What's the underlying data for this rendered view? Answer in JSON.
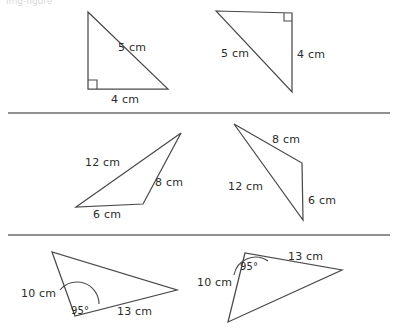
{
  "page": {
    "background_color": "#ffffff",
    "stroke_color": "#4a4a4a",
    "divider_color": "#6b6b6b",
    "text_color": "#2b2b2b",
    "cropped_top_text": "img-figure"
  },
  "rows": [
    {
      "name": "row-1-right-triangles",
      "figures": [
        {
          "name": "triangle-1",
          "labels": [
            {
              "name": "hypotenuse-label",
              "text": "5 cm",
              "x": 118,
              "y": 41
            },
            {
              "name": "base-label",
              "text": "4 cm",
              "x": 111,
              "y": 93
            }
          ],
          "right_angle": true
        },
        {
          "name": "triangle-2",
          "labels": [
            {
              "name": "hypotenuse-label",
              "text": "5 cm",
              "x": 221,
              "y": 47
            },
            {
              "name": "vertical-side-label",
              "text": "4 cm",
              "x": 297,
              "y": 48
            }
          ],
          "right_angle": true
        }
      ]
    },
    {
      "name": "row-2-scalene-triangles",
      "figures": [
        {
          "name": "triangle-3",
          "labels": [
            {
              "name": "side-12cm-label",
              "text": "12 cm",
              "x": 85,
              "y": 156
            },
            {
              "name": "side-8cm-label",
              "text": "8 cm",
              "x": 155,
              "y": 176
            },
            {
              "name": "side-6cm-label",
              "text": "6 cm",
              "x": 93,
              "y": 208
            }
          ],
          "right_angle": false
        },
        {
          "name": "triangle-4",
          "labels": [
            {
              "name": "side-8cm-label",
              "text": "8 cm",
              "x": 272,
              "y": 133
            },
            {
              "name": "side-12cm-label",
              "text": "12 cm",
              "x": 228,
              "y": 180
            },
            {
              "name": "side-6cm-label",
              "text": "6 cm",
              "x": 308,
              "y": 194
            }
          ],
          "right_angle": false
        }
      ]
    },
    {
      "name": "row-3-sas-triangles",
      "figures": [
        {
          "name": "triangle-5",
          "labels": [
            {
              "name": "side-10cm-label",
              "text": "10 cm",
              "x": 21,
              "y": 287
            },
            {
              "name": "angle-95-label",
              "text": "95°",
              "x": 71,
              "y": 305
            },
            {
              "name": "side-13cm-label",
              "text": "13 cm",
              "x": 117,
              "y": 305
            }
          ],
          "angle_marker": "95°"
        },
        {
          "name": "triangle-6",
          "labels": [
            {
              "name": "side-13cm-label",
              "text": "13 cm",
              "x": 288,
              "y": 250
            },
            {
              "name": "angle-95-label",
              "text": "95°",
              "x": 240,
              "y": 261
            },
            {
              "name": "side-10cm-label",
              "text": "10 cm",
              "x": 197,
              "y": 276
            }
          ],
          "angle_marker": "95°"
        }
      ]
    }
  ],
  "geometry": {
    "triangle_1": "M88,12 L88,89 L168,89 Z",
    "triangle_1_right_angle": "M88,80 L97,80 L97,89",
    "triangle_2": "M216,11 L292,13 L292,92 Z",
    "triangle_2_right_angle": "M284,13 L284,21 L292,21",
    "triangle_3": "M181,133 L76,207 L143,204 Z",
    "triangle_4": "M234,124 L302,163 L303,220 Z",
    "triangle_5": "M52,252 L75,316 L177,290 Z",
    "triangle_5_arc": "M60,290 A22,22 0 0,1 99,304",
    "triangle_6": "M245,253 L228,322 L342,270 Z",
    "triangle_6_arc": "M234,275 A22,22 0 0,1 268,261",
    "divider_1": "M8,113 L390,113",
    "divider_2": "M8,235 L390,235"
  }
}
